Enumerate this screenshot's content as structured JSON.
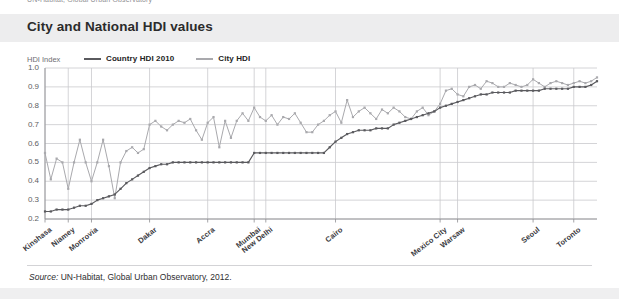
{
  "top_sliver_text": "UN-Habitat, Global Urban Observatory",
  "header": {
    "title": "City and National HDI values"
  },
  "legend": {
    "axis_title": "HDI Index",
    "items": [
      {
        "label": "Country HDI 2010",
        "color": "#5a5a5e"
      },
      {
        "label": "City HDI",
        "color": "#a9a9ad"
      }
    ]
  },
  "footer": {
    "source_label": "Source:",
    "source_text": " UN-Habitat, Global Urban Observatory, 2012."
  },
  "colors": {
    "header_band": "#ededee",
    "grid": "#c9c9cd",
    "axis": "#8e8e92",
    "country_line": "#5a5a5e",
    "city_line": "#a9a9ad",
    "title_text": "#2b2b2b"
  },
  "chart_data": {
    "type": "line",
    "title": "City and National HDI values",
    "xlabel": "",
    "ylabel": "HDI Index",
    "ylim": [
      0.2,
      1.0
    ],
    "yticks": [
      0.2,
      0.3,
      0.4,
      0.5,
      0.6,
      0.7,
      0.8,
      0.9,
      1.0
    ],
    "ytick_labels": [
      "0.2",
      "0.3",
      "0.4",
      "0.5",
      "0.6",
      "0.7",
      "0.8",
      "0.9",
      "1.0"
    ],
    "grid": true,
    "legend_position": "top",
    "x_count": 96,
    "xtick_labels": [
      {
        "label": "Kinshasa",
        "index": 0
      },
      {
        "label": "Niamey",
        "index": 4
      },
      {
        "label": "Monrovia",
        "index": 8
      },
      {
        "label": "Dakar",
        "index": 18
      },
      {
        "label": "Accra",
        "index": 28
      },
      {
        "label": "Mumbai",
        "index": 36
      },
      {
        "label": "New Delhi",
        "index": 38
      },
      {
        "label": "Cairo",
        "index": 50
      },
      {
        "label": "Mexico City",
        "index": 68
      },
      {
        "label": "Warsaw",
        "index": 71
      },
      {
        "label": "Seoul",
        "index": 84
      },
      {
        "label": "Toronto",
        "index": 91
      }
    ],
    "series": [
      {
        "name": "City HDI",
        "color": "#a9a9ad",
        "values": [
          0.55,
          0.41,
          0.52,
          0.5,
          0.36,
          0.5,
          0.62,
          0.5,
          0.4,
          0.5,
          0.62,
          0.48,
          0.31,
          0.5,
          0.56,
          0.58,
          0.55,
          0.57,
          0.7,
          0.72,
          0.69,
          0.67,
          0.7,
          0.72,
          0.71,
          0.73,
          0.67,
          0.62,
          0.71,
          0.74,
          0.58,
          0.72,
          0.63,
          0.72,
          0.76,
          0.72,
          0.79,
          0.74,
          0.72,
          0.75,
          0.7,
          0.74,
          0.73,
          0.76,
          0.71,
          0.66,
          0.66,
          0.7,
          0.72,
          0.75,
          0.77,
          0.71,
          0.83,
          0.74,
          0.77,
          0.79,
          0.76,
          0.73,
          0.78,
          0.76,
          0.79,
          0.77,
          0.74,
          0.73,
          0.77,
          0.79,
          0.75,
          0.77,
          0.81,
          0.88,
          0.89,
          0.86,
          0.85,
          0.9,
          0.91,
          0.89,
          0.93,
          0.92,
          0.9,
          0.9,
          0.92,
          0.91,
          0.9,
          0.91,
          0.94,
          0.92,
          0.9,
          0.92,
          0.93,
          0.92,
          0.91,
          0.92,
          0.93,
          0.92,
          0.93,
          0.95
        ]
      },
      {
        "name": "Country HDI 2010",
        "color": "#5a5a5e",
        "values": [
          0.24,
          0.24,
          0.25,
          0.25,
          0.25,
          0.26,
          0.27,
          0.27,
          0.28,
          0.3,
          0.31,
          0.32,
          0.33,
          0.36,
          0.39,
          0.41,
          0.43,
          0.45,
          0.47,
          0.48,
          0.49,
          0.49,
          0.5,
          0.5,
          0.5,
          0.5,
          0.5,
          0.5,
          0.5,
          0.5,
          0.5,
          0.5,
          0.5,
          0.5,
          0.5,
          0.5,
          0.55,
          0.55,
          0.55,
          0.55,
          0.55,
          0.55,
          0.55,
          0.55,
          0.55,
          0.55,
          0.55,
          0.55,
          0.55,
          0.58,
          0.61,
          0.63,
          0.65,
          0.66,
          0.67,
          0.67,
          0.67,
          0.68,
          0.68,
          0.68,
          0.7,
          0.71,
          0.72,
          0.73,
          0.74,
          0.75,
          0.76,
          0.77,
          0.79,
          0.8,
          0.81,
          0.82,
          0.83,
          0.84,
          0.85,
          0.86,
          0.86,
          0.87,
          0.87,
          0.87,
          0.87,
          0.88,
          0.88,
          0.88,
          0.88,
          0.88,
          0.89,
          0.89,
          0.89,
          0.89,
          0.89,
          0.9,
          0.9,
          0.9,
          0.91,
          0.93
        ]
      }
    ]
  }
}
